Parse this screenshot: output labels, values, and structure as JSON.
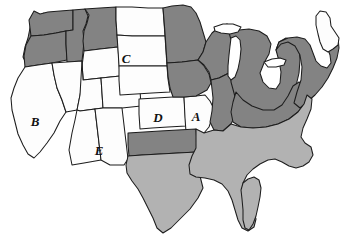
{
  "figure": {
    "width": 345,
    "height": 239,
    "background_color": "#ffffff"
  },
  "legend_tones": {
    "white_label": "white",
    "white_color": "#fdfdfd",
    "medium_gray_label": "medium gray",
    "medium_gray_color": "#b2b2b2",
    "dark_gray_label": "dark gray",
    "dark_gray_color": "#838383",
    "outline_color": "#1d1d1d"
  },
  "labels": [
    {
      "id": "label-a",
      "text": "A",
      "x": 196,
      "y": 118,
      "state": "Missouri"
    },
    {
      "id": "label-b",
      "text": "B",
      "x": 35,
      "y": 123,
      "state": "California"
    },
    {
      "id": "label-c",
      "text": "C",
      "x": 126,
      "y": 60,
      "state": "South Dakota"
    },
    {
      "id": "label-d",
      "text": "D",
      "x": 158,
      "y": 119,
      "state": "Kansas"
    },
    {
      "id": "label-e",
      "text": "E",
      "x": 99,
      "y": 152,
      "state": "New Mexico"
    }
  ],
  "states": [
    {
      "id": "washington",
      "name": "Washington",
      "tone": "dark"
    },
    {
      "id": "oregon",
      "name": "Oregon",
      "tone": "dark"
    },
    {
      "id": "idaho",
      "name": "Idaho",
      "tone": "dark"
    },
    {
      "id": "montana",
      "name": "Montana",
      "tone": "dark"
    },
    {
      "id": "wyoming",
      "name": "Wyoming",
      "tone": "white"
    },
    {
      "id": "california",
      "name": "California",
      "tone": "white"
    },
    {
      "id": "nevada",
      "name": "Nevada",
      "tone": "white"
    },
    {
      "id": "utah",
      "name": "Utah",
      "tone": "white"
    },
    {
      "id": "colorado",
      "name": "Colorado",
      "tone": "white"
    },
    {
      "id": "arizona",
      "name": "Arizona",
      "tone": "white"
    },
    {
      "id": "new-mexico",
      "name": "New Mexico",
      "tone": "white"
    },
    {
      "id": "north-dakota",
      "name": "North Dakota",
      "tone": "white"
    },
    {
      "id": "south-dakota",
      "name": "South Dakota",
      "tone": "white"
    },
    {
      "id": "nebraska",
      "name": "Nebraska",
      "tone": "white"
    },
    {
      "id": "kansas",
      "name": "Kansas",
      "tone": "white"
    },
    {
      "id": "missouri",
      "name": "Missouri",
      "tone": "white"
    },
    {
      "id": "oklahoma",
      "name": "Oklahoma",
      "tone": "dark"
    },
    {
      "id": "texas",
      "name": "Texas",
      "tone": "medium"
    },
    {
      "id": "minnesota",
      "name": "Minnesota",
      "tone": "dark"
    },
    {
      "id": "iowa",
      "name": "Iowa",
      "tone": "dark"
    },
    {
      "id": "wisconsin",
      "name": "Wisconsin",
      "tone": "dark"
    },
    {
      "id": "illinois",
      "name": "Illinois",
      "tone": "dark"
    },
    {
      "id": "michigan",
      "name": "Michigan",
      "tone": "dark"
    },
    {
      "id": "indiana-ohio",
      "name": "Indiana and Ohio",
      "tone": "dark"
    },
    {
      "id": "northeast",
      "name": "Northeast",
      "tone": "dark"
    },
    {
      "id": "maine",
      "name": "Maine",
      "tone": "white"
    },
    {
      "id": "southeast",
      "name": "Southeast",
      "tone": "medium"
    },
    {
      "id": "great-lakes",
      "name": "Great Lakes",
      "tone": "white"
    }
  ]
}
